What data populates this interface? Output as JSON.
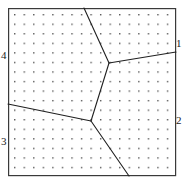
{
  "figure": {
    "title": "",
    "frame": {
      "x": 8,
      "y": 8,
      "width": 168,
      "height": 168,
      "stroke": "#3a3a3a",
      "stroke_width": 1.2
    },
    "background": "#ffffff"
  },
  "labels": [
    {
      "id": "1",
      "text": "1",
      "side": "right",
      "x": 176,
      "y": 38
    },
    {
      "id": "2",
      "text": "2",
      "side": "right",
      "x": 176,
      "y": 115
    },
    {
      "id": "3",
      "text": "3",
      "side": "left",
      "x": 1,
      "y": 136
    },
    {
      "id": "4",
      "text": "4",
      "side": "left",
      "x": 1,
      "y": 50
    }
  ],
  "chart_data": {
    "type": "diagram",
    "subtype": "voronoi-partition",
    "title": "",
    "xlabel": "",
    "ylabel": "",
    "region_count": 4,
    "region_names": [
      "1",
      "2",
      "3",
      "4"
    ],
    "dot_grid": {
      "visible": true,
      "color": "#555555",
      "dot_size": 1.4,
      "spacing_x": 9.55,
      "spacing_y": 9.55,
      "origin_x": 14,
      "origin_y": 14,
      "cols": 18,
      "rows": 18
    },
    "vertices": [
      {
        "name": "upper-junction",
        "x": 109,
        "y": 63
      },
      {
        "name": "lower-junction",
        "x": 91,
        "y": 121
      }
    ],
    "edges": [
      {
        "name": "edge-top",
        "from": [
          84,
          8
        ],
        "to": [
          109,
          63
        ],
        "stroke": "#202020",
        "stroke_width": 1.1
      },
      {
        "name": "edge-right",
        "from": [
          109,
          63
        ],
        "to": [
          176,
          52
        ],
        "stroke": "#202020",
        "stroke_width": 1.1
      },
      {
        "name": "edge-middle",
        "from": [
          109,
          63
        ],
        "to": [
          91,
          121
        ],
        "stroke": "#202020",
        "stroke_width": 1.1
      },
      {
        "name": "edge-left",
        "from": [
          91,
          121
        ],
        "to": [
          8,
          104
        ],
        "stroke": "#202020",
        "stroke_width": 1.1
      },
      {
        "name": "edge-bottom",
        "from": [
          91,
          121
        ],
        "to": [
          129,
          176
        ],
        "stroke": "#202020",
        "stroke_width": 1.1
      }
    ],
    "grid": false,
    "legend": "none"
  }
}
